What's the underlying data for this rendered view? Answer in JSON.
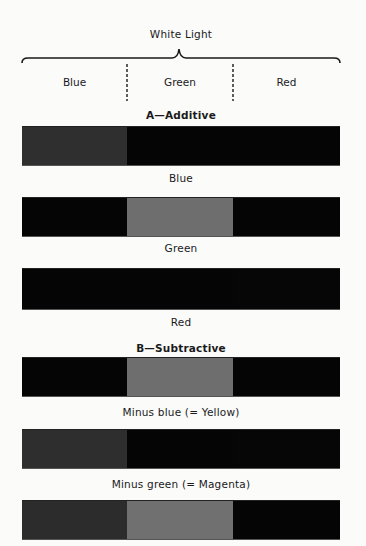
{
  "header": {
    "title": "White Light",
    "bands": [
      "Blue",
      "Green",
      "Red"
    ]
  },
  "sections": {
    "additive": {
      "heading": "A—Additive",
      "rows": [
        {
          "caption": "Blue",
          "segments": [
            "#2f2f2f",
            "#050505",
            "#050505"
          ]
        },
        {
          "caption": "Green",
          "segments": [
            "#050505",
            "#6e6e6e",
            "#050505"
          ]
        },
        {
          "caption": "Red",
          "segments": [
            "#050505",
            "#050505",
            "#060606"
          ]
        }
      ]
    },
    "subtractive": {
      "heading": "B—Subtractive",
      "rows": [
        {
          "caption": "Minus blue (= Yellow)",
          "segments": [
            "#050505",
            "#6e6e6e",
            "#050505"
          ]
        },
        {
          "caption": "Minus green (= Magenta)",
          "segments": [
            "#2e2e2e",
            "#050505",
            "#060606"
          ]
        },
        {
          "caption": "",
          "segments": [
            "#2c2c2c",
            "#707070",
            "#050505"
          ]
        }
      ]
    }
  },
  "colors": {
    "background": "#fbfbfa",
    "black": "#050505",
    "dark_gray": "#2f2f2f",
    "mid_gray": "#6e6e6e"
  }
}
